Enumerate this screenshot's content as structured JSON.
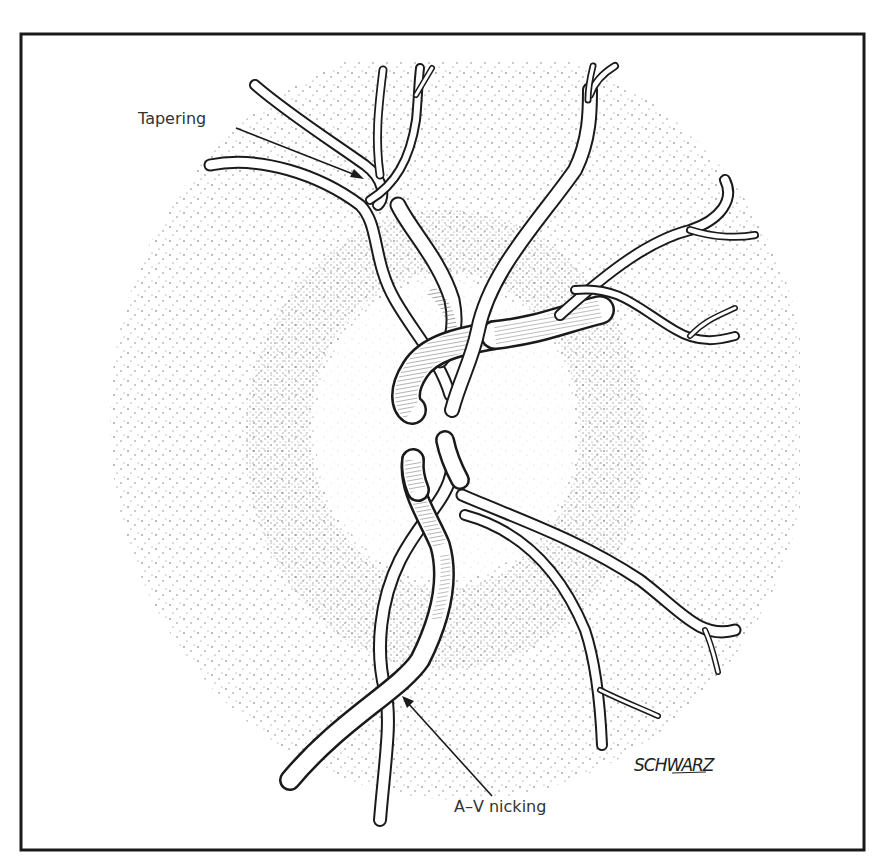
{
  "figure": {
    "colors": {
      "ink": "#1a1a1a",
      "stipple": "#333333",
      "background": "#ffffff",
      "label": "#333333"
    },
    "frame": {
      "x": 21,
      "y": 34,
      "width": 843,
      "height": 816
    }
  },
  "labels": {
    "tapering": {
      "text": "Tapering",
      "x": 138,
      "y": 124
    },
    "av_nicking": {
      "text": "A–V nicking",
      "x": 454,
      "y": 812
    }
  },
  "signature": {
    "text": "SCHWARZ",
    "x": 634,
    "y": 771
  },
  "annotations": [
    {
      "name": "tapering-arrow",
      "from": [
        236,
        128
      ],
      "to": [
        362,
        178
      ]
    },
    {
      "name": "av-nicking-arrow",
      "from": [
        492,
        796
      ],
      "to": [
        403,
        698
      ]
    }
  ],
  "disc": {
    "cx": 445,
    "cy": 430,
    "rx": 135,
    "ry": 155
  }
}
